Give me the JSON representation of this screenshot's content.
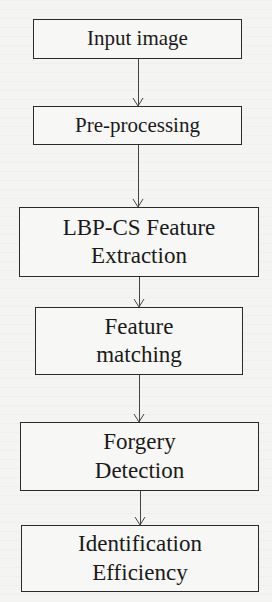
{
  "diagram": {
    "type": "flowchart",
    "direction": "top-to-bottom",
    "nodes": [
      {
        "id": "input-image",
        "lines": [
          "Input image"
        ]
      },
      {
        "id": "pre-processing",
        "lines": [
          "Pre-processing"
        ]
      },
      {
        "id": "lbp-cs-feature-extraction",
        "lines": [
          "LBP-CS Feature",
          "Extraction"
        ]
      },
      {
        "id": "feature-matching",
        "lines": [
          "Feature",
          "matching"
        ]
      },
      {
        "id": "forgery-detection",
        "lines": [
          "Forgery",
          "Detection"
        ]
      },
      {
        "id": "identification-efficiency",
        "lines": [
          "Identification",
          "Efficiency"
        ]
      }
    ],
    "edges": [
      {
        "from": "input-image",
        "to": "pre-processing"
      },
      {
        "from": "pre-processing",
        "to": "lbp-cs-feature-extraction"
      },
      {
        "from": "lbp-cs-feature-extraction",
        "to": "feature-matching"
      },
      {
        "from": "feature-matching",
        "to": "forgery-detection"
      },
      {
        "from": "forgery-detection",
        "to": "identification-efficiency"
      }
    ],
    "colors": {
      "border": "#2a2a2a",
      "text": "#1a1a1a",
      "background": "#f4f4f2"
    }
  }
}
